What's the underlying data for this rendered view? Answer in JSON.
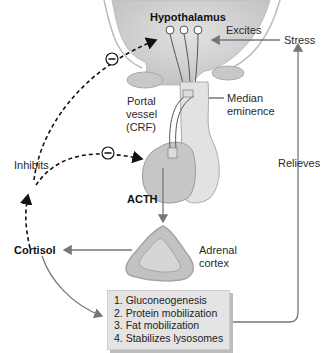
{
  "diagram": {
    "labels": {
      "hypothalamus": "Hypothalamus",
      "excites": "Excites",
      "stress": "Stress",
      "portal_vessel_line1": "Portal",
      "portal_vessel_line2": "vessel",
      "portal_vessel_line3": "(CRF)",
      "median_eminence_line1": "Median",
      "median_eminence_line2": "eminence",
      "inhibits": "Inhibits",
      "acth": "ACTH",
      "relieves": "Relieves",
      "cortisol": "Cortisol",
      "adrenal_cortex_line1": "Adrenal",
      "adrenal_cortex_line2": "cortex"
    },
    "effects": [
      "1. Gluconeogenesis",
      "2. Protein mobilization",
      "3. Fat mobilization",
      "4. Stabilizes lysosomes"
    ],
    "inhibit_symbols": [
      "minus",
      "minus"
    ],
    "colors": {
      "organ_fill": "#c9c9c9",
      "organ_light": "#e0e0e0",
      "arrow": "#777777",
      "dashed": "#111111",
      "box_fill": "#e4e4e4"
    }
  }
}
